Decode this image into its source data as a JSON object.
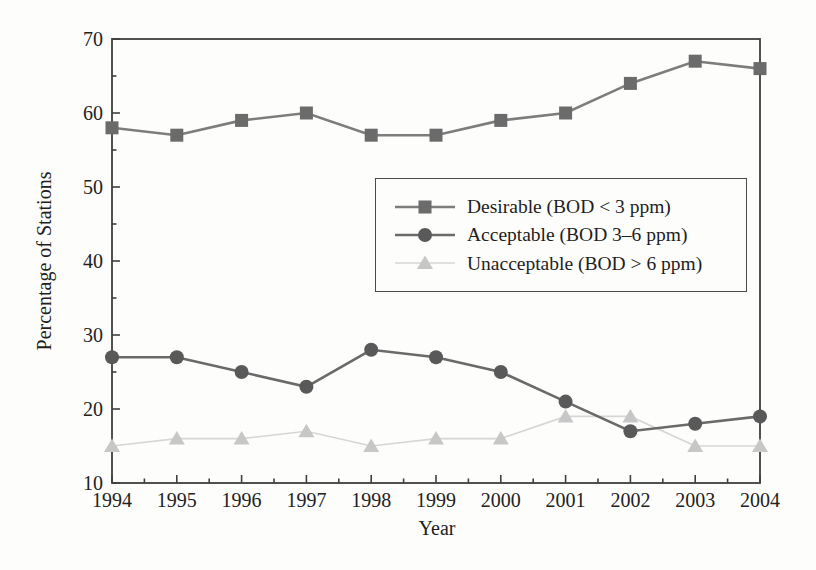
{
  "figure": {
    "type_note": "statistical line chart, scanned-book style, no title"
  },
  "chart_data": {
    "type": "line",
    "title": "",
    "xlabel": "Year",
    "ylabel": "Percentage of Stations",
    "x": [
      1994,
      1995,
      1996,
      1997,
      1998,
      1999,
      2000,
      2001,
      2002,
      2003,
      2004
    ],
    "x_range": [
      1994,
      2004
    ],
    "ylim": [
      10,
      70
    ],
    "yticks": [
      10,
      20,
      30,
      40,
      50,
      60,
      70
    ],
    "y_minor_step": 5,
    "x_minor_step": 0.5,
    "grid": false,
    "legend_position": "inside upper right",
    "frame_color": "#3f3f3f",
    "series": [
      {
        "name": "Desirable (BOD < 3 ppm)",
        "marker": "square",
        "marker_color": "#6b6b6b",
        "line_color": "#7d7d7d",
        "line_width": 2.6,
        "values": [
          58,
          57,
          59,
          60,
          57,
          57,
          59,
          60,
          64,
          67,
          66
        ]
      },
      {
        "name": "Acceptable (BOD 3–6 ppm)",
        "marker": "circle",
        "marker_color": "#595959",
        "line_color": "#6a6a6a",
        "line_width": 2.6,
        "values": [
          27,
          27,
          25,
          23,
          28,
          27,
          25,
          21,
          17,
          18,
          19
        ]
      },
      {
        "name": "Unacceptable (BOD > 6 ppm)",
        "marker": "triangle",
        "marker_color": "#c7c7c7",
        "line_color": "#d6d6d6",
        "line_width": 1.6,
        "values": [
          15,
          16,
          16,
          17,
          15,
          16,
          16,
          19,
          19,
          15,
          15
        ]
      }
    ]
  }
}
